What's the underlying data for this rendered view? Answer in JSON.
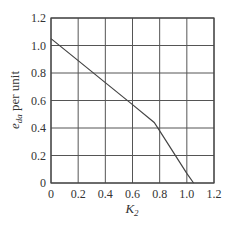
{
  "chart_data": {
    "type": "line",
    "title": "",
    "xlabel": "K2",
    "ylabel": "e_da per unit",
    "xlim": [
      0,
      1.2
    ],
    "ylim": [
      0,
      1.2
    ],
    "x_ticks": [
      "0",
      "0.2",
      "0.4",
      "0.6",
      "0.8",
      "1.0",
      "1.2"
    ],
    "y_ticks": [
      "0",
      "0.2",
      "0.4",
      "0.6",
      "0.8",
      "1.0",
      "1.2"
    ],
    "grid": true,
    "legend": null,
    "series": [
      {
        "name": "e_da",
        "x": [
          0,
          0.2,
          0.4,
          0.6,
          0.76,
          0.8,
          1.0,
          1.05
        ],
        "y": [
          1.05,
          0.89,
          0.73,
          0.57,
          0.44,
          0.38,
          0.07,
          0.0
        ]
      }
    ]
  },
  "labels": {
    "xlabel_main": "K",
    "xlabel_sub": "2",
    "ylabel_main": "e",
    "ylabel_sub": "da",
    "ylabel_rest": " per unit"
  }
}
